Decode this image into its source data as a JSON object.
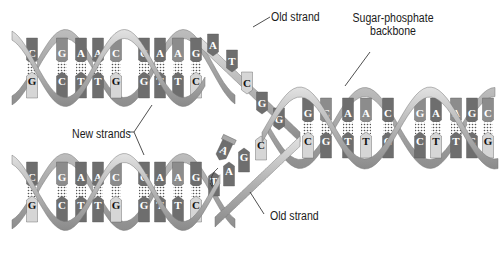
{
  "diagram": {
    "labels": {
      "old_strand_top": "Old strand",
      "sugar_phosphate_line1": "Sugar-phosphate",
      "sugar_phosphate_line2": "backbone",
      "new_strands": "New strands",
      "old_strand_bottom": "Old strand"
    },
    "colors": {
      "backbone_light": "#cfcfcf",
      "backbone_mid": "#a8a8a8",
      "backbone_dark": "#7a7a7a",
      "base_dark": "#6e6e6e",
      "base_mid": "#8c8c8c",
      "base_light": "#d6d6d6",
      "letter": "#ffffff",
      "letter_dark": "#111111",
      "leader_line": "#222222"
    },
    "top_helix": {
      "pairs": [
        {
          "x": 32,
          "top": "C",
          "bottom": "G"
        },
        {
          "x": 62,
          "top": "G",
          "bottom": "C"
        },
        {
          "x": 81,
          "top": "A",
          "bottom": "T"
        },
        {
          "x": 98,
          "top": "A",
          "bottom": "T"
        },
        {
          "x": 116,
          "top": "C",
          "bottom": "G"
        },
        {
          "x": 144,
          "top": "C",
          "bottom": "G"
        },
        {
          "x": 160,
          "top": "A",
          "bottom": "T"
        },
        {
          "x": 178,
          "top": "A",
          "bottom": "T"
        },
        {
          "x": 196,
          "top": "G",
          "bottom": "C"
        }
      ],
      "unpaired_old": [
        "A",
        "T",
        "C",
        "G",
        "G"
      ]
    },
    "bottom_helix": {
      "pairs": [
        {
          "x": 32,
          "top": "C",
          "bottom": "G"
        },
        {
          "x": 62,
          "top": "G",
          "bottom": "C"
        },
        {
          "x": 81,
          "top": "A",
          "bottom": "T"
        },
        {
          "x": 98,
          "top": "A",
          "bottom": "T"
        },
        {
          "x": 116,
          "top": "C",
          "bottom": "G"
        },
        {
          "x": 144,
          "top": "C",
          "bottom": "G"
        },
        {
          "x": 160,
          "top": "A",
          "bottom": "T"
        },
        {
          "x": 178,
          "top": "A",
          "bottom": "T"
        },
        {
          "x": 196,
          "top": "G",
          "bottom": "C"
        }
      ],
      "incoming_nucleotide": "A",
      "unpaired_old": [
        "T",
        "A",
        "G",
        "C"
      ]
    },
    "parent_helix": {
      "pairs": [
        {
          "top": "G",
          "bottom": "C"
        },
        {
          "top": "C",
          "bottom": "G"
        },
        {
          "top": "A",
          "bottom": "T"
        },
        {
          "top": "A",
          "bottom": "T"
        },
        {
          "top": "C",
          "bottom": "G"
        },
        {
          "top": "G",
          "bottom": "C"
        },
        {
          "top": "A",
          "bottom": "T"
        },
        {
          "top": "A",
          "bottom": "T"
        },
        {
          "top": "G",
          "bottom": "C"
        },
        {
          "top": "C",
          "bottom": "G"
        }
      ]
    }
  }
}
